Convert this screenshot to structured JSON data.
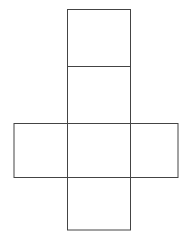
{
  "diagram": {
    "type": "cube-net",
    "stroke_color": "#444444",
    "background": "#ffffff",
    "faces": [
      {
        "id": "top",
        "x": 67.5,
        "y": 9.5,
        "w": 63,
        "h": 57
      },
      {
        "id": "upper-middle",
        "x": 67.5,
        "y": 66.5,
        "w": 63,
        "h": 57
      },
      {
        "id": "left",
        "x": 14,
        "y": 123.5,
        "w": 53.5,
        "h": 54
      },
      {
        "id": "center",
        "x": 67.5,
        "y": 123.5,
        "w": 63,
        "h": 54
      },
      {
        "id": "right",
        "x": 130.5,
        "y": 123.5,
        "w": 47.5,
        "h": 54
      },
      {
        "id": "bottom",
        "x": 67.5,
        "y": 177.5,
        "w": 63,
        "h": 52.5
      }
    ]
  }
}
